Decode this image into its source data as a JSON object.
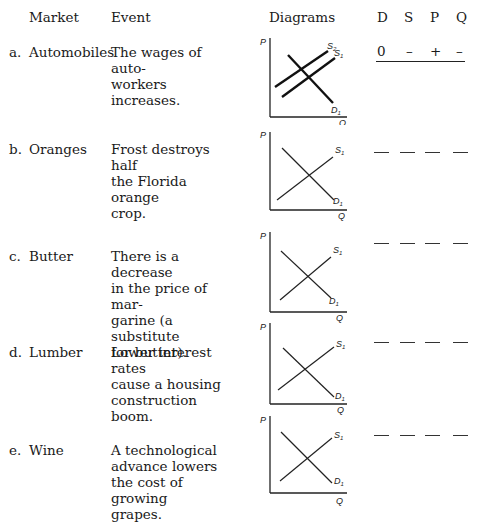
{
  "header": {
    "market": "Market",
    "event": "Event",
    "diagrams": "Diagrams",
    "cols": [
      "D",
      "S",
      "P",
      "Q"
    ]
  },
  "rows": [
    {
      "letter": "a.",
      "market": "Automobiles",
      "event_lines": [
        "The wages of auto-",
        "workers",
        "increases."
      ],
      "diagram": {
        "curves": [
          "S2",
          "S1",
          "D1"
        ],
        "labels": {
          "p": "P",
          "q": "Q",
          "s2": "S",
          "s2_sub": "2",
          "s1": "S",
          "s1_sub": "1",
          "d1": "D",
          "d1_sub": "1"
        }
      },
      "answers": [
        "0",
        "–",
        "+",
        "–"
      ]
    },
    {
      "letter": "b.",
      "market": "Oranges",
      "event_lines": [
        "Frost destroys half",
        "the Florida orange",
        "crop."
      ],
      "diagram": {
        "curves": [
          "S1",
          "D1"
        ],
        "labels": {
          "p": "P",
          "q": "Q",
          "s1": "S",
          "s1_sub": "1",
          "d1": "D",
          "d1_sub": "1"
        }
      },
      "answers": [
        "",
        "",
        "",
        ""
      ]
    },
    {
      "letter": "c.",
      "market": "Butter",
      "event_lines": [
        "There is a decrease",
        "in the price of mar-",
        "garine (a substitute",
        "for butter)."
      ],
      "diagram": {
        "curves": [
          "S1",
          "D1"
        ],
        "labels": {
          "p": "P",
          "q": "Q",
          "s1": "S",
          "s1_sub": "1",
          "d1": "D",
          "d1_sub": "1"
        }
      },
      "answers": [
        "",
        "",
        "",
        ""
      ]
    },
    {
      "letter": "d.",
      "market": "Lumber",
      "event_lines": [
        "Lower interest rates",
        "cause a housing",
        "construction boom."
      ],
      "diagram": {
        "curves": [
          "S1",
          "D1"
        ],
        "labels": {
          "p": "P",
          "q": "Q",
          "s1": "S",
          "s1_sub": "1",
          "d1": "D",
          "d1_sub": "1"
        }
      },
      "answers": [
        "",
        "",
        "",
        ""
      ]
    },
    {
      "letter": "e.",
      "market": "Wine",
      "event_lines": [
        "A technological",
        "advance lowers",
        "the cost of growing",
        "grapes."
      ],
      "diagram": {
        "curves": [
          "S1",
          "D1"
        ],
        "labels": {
          "p": "P",
          "q": "Q",
          "s1": "S",
          "s1_sub": "1",
          "d1": "D",
          "d1_sub": "1"
        }
      },
      "answers": [
        "",
        "",
        "",
        ""
      ]
    }
  ]
}
